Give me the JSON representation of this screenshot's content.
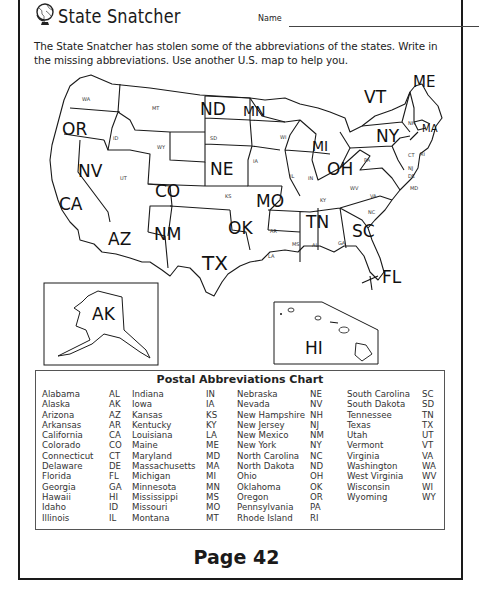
{
  "header": {
    "title": "State Snatcher",
    "name_label": "Name",
    "globe_icon": "globe-icon"
  },
  "instructions": "The State Snatcher has stolen some of the abbreviations of the states. Write in the missing abbreviations. Use another U.S. map to help you.",
  "map": {
    "handwritten_labels": [
      "ME",
      "VT",
      "OR",
      "ND",
      "MN",
      "MI",
      "NY",
      "MA",
      "NV",
      "OH",
      "NE",
      "CO",
      "MO",
      "CA",
      "OK",
      "TN",
      "SC",
      "AZ",
      "NM",
      "TX",
      "FL",
      "AK",
      "HI"
    ],
    "printed_labels": [
      "WA",
      "MT",
      "ID",
      "WY",
      "SD",
      "UT",
      "KS",
      "IA",
      "WI",
      "IL",
      "IN",
      "PA",
      "NH",
      "CT",
      "RI",
      "NJ",
      "DE",
      "MD",
      "WV",
      "VA",
      "KY",
      "NC",
      "AR",
      "LA",
      "MS",
      "AL",
      "GA"
    ],
    "inset_labels": {
      "alaska": "AK",
      "hawaii": "HI"
    }
  },
  "chart": {
    "title": "Postal Abbreviations Chart",
    "columns": [
      [
        {
          "state": "Alabama",
          "abbr": "AL"
        },
        {
          "state": "Alaska",
          "abbr": "AK"
        },
        {
          "state": "Arizona",
          "abbr": "AZ"
        },
        {
          "state": "Arkansas",
          "abbr": "AR"
        },
        {
          "state": "California",
          "abbr": "CA"
        },
        {
          "state": "Colorado",
          "abbr": "CO"
        },
        {
          "state": "Connecticut",
          "abbr": "CT"
        },
        {
          "state": "Delaware",
          "abbr": "DE"
        },
        {
          "state": "Florida",
          "abbr": "FL"
        },
        {
          "state": "Georgia",
          "abbr": "GA"
        },
        {
          "state": "Hawaii",
          "abbr": "HI"
        },
        {
          "state": "Idaho",
          "abbr": "ID"
        },
        {
          "state": "Illinois",
          "abbr": "IL"
        }
      ],
      [
        {
          "state": "Indiana",
          "abbr": "IN"
        },
        {
          "state": "Iowa",
          "abbr": "IA"
        },
        {
          "state": "Kansas",
          "abbr": "KS"
        },
        {
          "state": "Kentucky",
          "abbr": "KY"
        },
        {
          "state": "Louisiana",
          "abbr": "LA"
        },
        {
          "state": "Maine",
          "abbr": "ME"
        },
        {
          "state": "Maryland",
          "abbr": "MD"
        },
        {
          "state": "Massachusetts",
          "abbr": "MA"
        },
        {
          "state": "Michigan",
          "abbr": "MI"
        },
        {
          "state": "Minnesota",
          "abbr": "MN"
        },
        {
          "state": "Mississippi",
          "abbr": "MS"
        },
        {
          "state": "Missouri",
          "abbr": "MO"
        },
        {
          "state": "Montana",
          "abbr": "MT"
        }
      ],
      [
        {
          "state": "Nebraska",
          "abbr": "NE"
        },
        {
          "state": "Nevada",
          "abbr": "NV"
        },
        {
          "state": "New Hampshire",
          "abbr": "NH"
        },
        {
          "state": "New Jersey",
          "abbr": "NJ"
        },
        {
          "state": "New Mexico",
          "abbr": "NM"
        },
        {
          "state": "New York",
          "abbr": "NY"
        },
        {
          "state": "North Carolina",
          "abbr": "NC"
        },
        {
          "state": "North Dakota",
          "abbr": "ND"
        },
        {
          "state": "Ohio",
          "abbr": "OH"
        },
        {
          "state": "Oklahoma",
          "abbr": "OK"
        },
        {
          "state": "Oregon",
          "abbr": "OR"
        },
        {
          "state": "Pennsylvania",
          "abbr": "PA"
        },
        {
          "state": "Rhode Island",
          "abbr": "RI"
        }
      ],
      [
        {
          "state": "South Carolina",
          "abbr": "SC"
        },
        {
          "state": "South Dakota",
          "abbr": "SD"
        },
        {
          "state": "Tennessee",
          "abbr": "TN"
        },
        {
          "state": "Texas",
          "abbr": "TX"
        },
        {
          "state": "Utah",
          "abbr": "UT"
        },
        {
          "state": "Vermont",
          "abbr": "VT"
        },
        {
          "state": "Virginia",
          "abbr": "VA"
        },
        {
          "state": "Washington",
          "abbr": "WA"
        },
        {
          "state": "West Virginia",
          "abbr": "WV"
        },
        {
          "state": "Wisconsin",
          "abbr": "WI"
        },
        {
          "state": "Wyoming",
          "abbr": "WY"
        }
      ]
    ]
  },
  "footer": {
    "page_label": "Page 42"
  }
}
